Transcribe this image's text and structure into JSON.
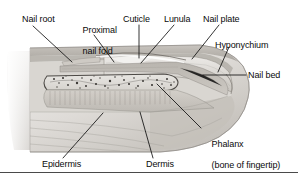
{
  "figure": {
    "style": "grayscale pencil-shaded medical illustration",
    "width": 298,
    "height": 179,
    "background_color": "#ffffff",
    "text_color": "#0a0a0a",
    "leader_line_color": "#111111",
    "rule_color": "#4a4a4a"
  },
  "labels": {
    "nail_root": "Nail root",
    "proximal_nail_fold_line1": "Proximal",
    "proximal_nail_fold_line2": "nail fold",
    "cuticle": "Cuticle",
    "lunula": "Lunula",
    "nail_plate": "Nail plate",
    "hyponychium": "Hyponychium",
    "nail_bed": "Nail bed",
    "phalanx_line1": "Phalanx",
    "phalanx_line2": "(bone of fingertip)",
    "epidermis": "Epidermis",
    "dermis": "Dermis"
  },
  "anatomy_parts": [
    "Nail root",
    "Proximal nail fold",
    "Cuticle",
    "Lunula",
    "Nail plate",
    "Hyponychium",
    "Nail bed",
    "Phalanx (bone of fingertip)",
    "Epidermis",
    "Dermis"
  ],
  "palette": {
    "skin_light": "#e9e7e4",
    "skin_mid": "#cfccc7",
    "skin_dark": "#a9a5a0",
    "nail_plate": "#dedcd8",
    "nail_bed": "#bfbbb5",
    "bone_fill": "#e2e0dc",
    "bone_outline": "#55524e",
    "dermis": "#c6c2bc",
    "shadow": "#8c8882"
  }
}
